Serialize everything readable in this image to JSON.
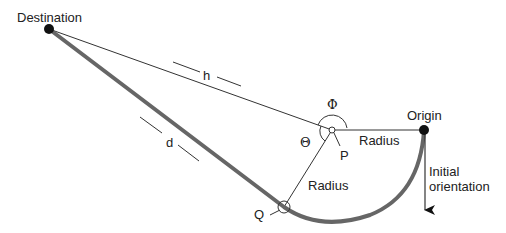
{
  "labels": {
    "destination": "Destination",
    "origin": "Origin",
    "h": "h",
    "d": "d",
    "phi": "Φ",
    "theta": "Θ",
    "p": "P",
    "q": "Q",
    "radius_top": "Radius",
    "radius_bottom": "Radius",
    "initial_orientation_line1": "Initial",
    "initial_orientation_line2": "orientation"
  },
  "colors": {
    "path": "#666666",
    "thin_line": "#333333",
    "dot": "#111111",
    "text": "#222222"
  }
}
